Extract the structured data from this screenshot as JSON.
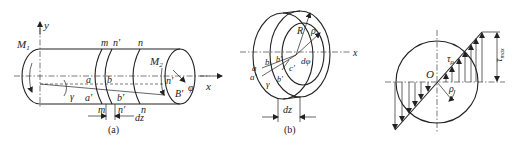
{
  "figure": {
    "panel_a": {
      "caption": "(a)",
      "labels": {
        "y_axis": "y",
        "x_axis": "x",
        "moment_left": "M",
        "moment_left_sub": "1",
        "moment_right": "M",
        "moment_right_sub": "2",
        "m_top": "m",
        "n_prime_top": "n'",
        "n_top": "n",
        "a": "a",
        "b": "b",
        "a_prime": "a'",
        "b_prime": "b'",
        "gamma": "γ",
        "m_bottom": "m",
        "n_prime_bottom": "n'",
        "n_bottom": "n",
        "dz": "dz",
        "n_end": "n'",
        "B_prime": "B'",
        "phi": "φ"
      }
    },
    "panel_b": {
      "caption": "(b)",
      "labels": {
        "R": "R",
        "rho": "ρ",
        "x_axis": "x",
        "a": "a",
        "a_prime": "a'",
        "b": "b",
        "b_prime": "b'",
        "b_prime2": "b'",
        "c_prime": "c'",
        "gamma": "γ",
        "d_phi": "dφ",
        "dz": "dz"
      }
    },
    "panel_c": {
      "labels": {
        "O": "O",
        "tau_rho": "τ",
        "tau_rho_sub": "ρ",
        "rho": "ρ",
        "tau_max": "τ",
        "tau_max_sub": "max"
      }
    }
  }
}
